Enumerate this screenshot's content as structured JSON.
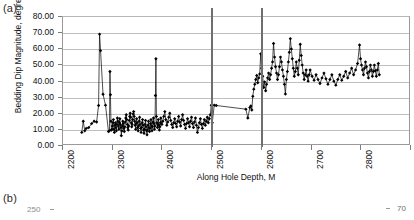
{
  "panels": {
    "a_label": "(a)",
    "b_label": "(b)"
  },
  "figure_b_partial": {
    "left_tick_label": "250",
    "right_tick_label": "70"
  },
  "chart_data": {
    "type": "line",
    "title": "",
    "xlabel": "Along Hole Depth, M",
    "ylabel": "Bedding Dip Magnitude, degreed",
    "xlim": [
      2200,
      2900
    ],
    "ylim": [
      0,
      80
    ],
    "grid": true,
    "legend": "none",
    "marker": "filled-diamond",
    "line_color": "#000000",
    "marker_color": "#000000",
    "grid_color": "#bfbfbf",
    "xticks": [
      2200,
      2300,
      2400,
      2500,
      2600,
      2700,
      2800,
      2900
    ],
    "xtick_labels": [
      "2200",
      "2300",
      "2400",
      "2500",
      "2600",
      "2700",
      "2800",
      "2900"
    ],
    "xtick_rotation": -90,
    "yticks": [
      0,
      10,
      20,
      30,
      40,
      50,
      60,
      70,
      80
    ],
    "ytick_labels": [
      "0.00",
      "10.00",
      "20.00",
      "30.00",
      "40.00",
      "50.00",
      "60.00",
      "70.00",
      "80.00"
    ],
    "annotations": [
      {
        "type": "vertical-line",
        "x": 2500,
        "color": "#6e6e6e",
        "label": ""
      },
      {
        "type": "vertical-line",
        "x": 2600,
        "color": "#6e6e6e",
        "label": ""
      }
    ],
    "series": [
      {
        "name": "Bedding Dip Magnitude",
        "x": [
          2238,
          2241,
          2244,
          2247,
          2252,
          2258,
          2263,
          2268,
          2272,
          2274,
          2276,
          2281,
          2286,
          2292,
          2294,
          2295,
          2296,
          2297,
          2298,
          2299,
          2300,
          2301,
          2302,
          2303,
          2304,
          2305,
          2306,
          2307,
          2308,
          2309,
          2310,
          2311,
          2312,
          2313,
          2314,
          2315,
          2316,
          2317,
          2318,
          2319,
          2320,
          2321,
          2322,
          2323,
          2324,
          2325,
          2326,
          2327,
          2328,
          2329,
          2330,
          2331,
          2332,
          2333,
          2334,
          2335,
          2336,
          2337,
          2338,
          2339,
          2340,
          2341,
          2342,
          2343,
          2344,
          2345,
          2346,
          2347,
          2348,
          2349,
          2350,
          2351,
          2352,
          2353,
          2354,
          2355,
          2356,
          2357,
          2358,
          2359,
          2360,
          2361,
          2362,
          2363,
          2364,
          2365,
          2366,
          2367,
          2368,
          2369,
          2370,
          2371,
          2372,
          2373,
          2374,
          2375,
          2376,
          2377,
          2378,
          2379,
          2380,
          2381,
          2382,
          2383,
          2384,
          2385,
          2386,
          2387,
          2388,
          2389,
          2390,
          2391,
          2392,
          2393,
          2394,
          2395,
          2396,
          2397,
          2398,
          2400,
          2402,
          2404,
          2406,
          2408,
          2410,
          2412,
          2414,
          2416,
          2418,
          2420,
          2422,
          2424,
          2426,
          2428,
          2430,
          2432,
          2434,
          2436,
          2438,
          2440,
          2442,
          2444,
          2446,
          2448,
          2450,
          2452,
          2454,
          2456,
          2458,
          2460,
          2462,
          2464,
          2466,
          2468,
          2470,
          2472,
          2474,
          2476,
          2478,
          2480,
          2482,
          2484,
          2486,
          2488,
          2490,
          2492,
          2494,
          2496,
          2498,
          2500,
          2502,
          2506,
          2510,
          2570,
          2574,
          2578,
          2580,
          2582,
          2584,
          2586,
          2588,
          2590,
          2592,
          2594,
          2596,
          2598,
          2600,
          2602,
          2604,
          2606,
          2608,
          2610,
          2612,
          2614,
          2616,
          2618,
          2620,
          2622,
          2624,
          2626,
          2628,
          2630,
          2632,
          2634,
          2636,
          2638,
          2640,
          2642,
          2644,
          2646,
          2648,
          2650,
          2652,
          2654,
          2656,
          2658,
          2660,
          2662,
          2664,
          2666,
          2668,
          2670,
          2672,
          2674,
          2676,
          2678,
          2680,
          2682,
          2684,
          2686,
          2688,
          2690,
          2692,
          2694,
          2696,
          2698,
          2700,
          2704,
          2708,
          2712,
          2716,
          2720,
          2724,
          2728,
          2732,
          2736,
          2740,
          2744,
          2748,
          2752,
          2756,
          2760,
          2764,
          2768,
          2772,
          2776,
          2780,
          2784,
          2788,
          2792,
          2796,
          2800,
          2802,
          2804,
          2806,
          2808,
          2810,
          2812,
          2814,
          2816,
          2818,
          2820,
          2822,
          2824,
          2826,
          2828,
          2830,
          2832,
          2834,
          2836,
          2838,
          2840
        ],
        "y": [
          8.0,
          15.0,
          9.0,
          10.5,
          11.0,
          13.5,
          15.0,
          14.5,
          24.8,
          69.3,
          59.0,
          31.8,
          25.0,
          8.5,
          9.0,
          46.0,
          31.5,
          15.0,
          9.5,
          10.0,
          12.0,
          14.0,
          16.0,
          10.0,
          8.0,
          12.5,
          14.0,
          11.0,
          9.0,
          13.0,
          17.0,
          15.0,
          12.0,
          10.0,
          14.0,
          16.5,
          13.0,
          11.0,
          6.0,
          9.0,
          12.0,
          15.0,
          13.5,
          10.5,
          8.5,
          11.5,
          14.5,
          17.0,
          19.0,
          16.0,
          13.0,
          11.0,
          9.5,
          12.0,
          15.5,
          18.0,
          20.0,
          17.5,
          14.0,
          11.5,
          13.0,
          16.0,
          19.5,
          21.0,
          18.0,
          15.0,
          12.5,
          10.0,
          13.5,
          16.5,
          14.0,
          11.0,
          9.0,
          12.0,
          15.0,
          17.5,
          13.0,
          10.5,
          8.0,
          11.0,
          14.0,
          16.0,
          12.5,
          9.5,
          7.5,
          10.0,
          13.0,
          15.5,
          11.5,
          9.0,
          6.5,
          9.5,
          12.5,
          15.0,
          11.0,
          8.5,
          10.5,
          13.5,
          16.0,
          12.0,
          9.0,
          11.5,
          14.5,
          17.0,
          13.5,
          10.0,
          12.0,
          31.0,
          54.0,
          18.0,
          14.0,
          11.0,
          13.0,
          16.0,
          12.5,
          9.5,
          11.5,
          14.0,
          17.0,
          13.0,
          15.0,
          18.0,
          21.0,
          16.0,
          12.5,
          14.5,
          17.5,
          20.0,
          15.5,
          13.0,
          11.0,
          14.0,
          16.5,
          13.5,
          11.5,
          15.0,
          18.0,
          14.5,
          12.0,
          16.0,
          19.0,
          15.5,
          13.0,
          10.5,
          13.5,
          16.5,
          14.0,
          11.5,
          15.0,
          17.5,
          13.5,
          11.0,
          14.5,
          17.0,
          12.5,
          8.0,
          11.0,
          14.0,
          16.5,
          13.0,
          10.5,
          13.5,
          16.0,
          12.5,
          15.0,
          17.5,
          14.0,
          16.5,
          19.0,
          25.0,
          14.0,
          25.0,
          24.8,
          22.5,
          17.0,
          23.5,
          24.5,
          22.0,
          30.5,
          35.0,
          38.0,
          41.0,
          43.5,
          39.0,
          42.0,
          44.5,
          57.0,
          48.0,
          43.0,
          36.0,
          39.5,
          34.0,
          38.0,
          42.0,
          45.0,
          41.0,
          44.0,
          48.0,
          52.0,
          63.5,
          55.0,
          49.0,
          45.0,
          41.0,
          44.0,
          49.0,
          55.0,
          52.0,
          47.0,
          43.0,
          38.0,
          32.0,
          41.0,
          46.0,
          52.0,
          58.0,
          66.5,
          60.0,
          54.0,
          48.0,
          43.0,
          46.0,
          52.0,
          48.0,
          44.0,
          53.0,
          63.0,
          56.0,
          50.0,
          45.0,
          41.0,
          44.0,
          47.0,
          43.0,
          40.0,
          44.0,
          47.0,
          43.0,
          40.5,
          44.0,
          41.0,
          38.5,
          42.0,
          45.0,
          41.5,
          38.0,
          41.0,
          44.0,
          40.0,
          37.5,
          41.0,
          44.0,
          40.5,
          43.0,
          46.0,
          42.0,
          45.0,
          48.0,
          44.0,
          47.0,
          51.0,
          62.5,
          54.0,
          50.0,
          47.0,
          44.0,
          48.0,
          52.0,
          49.0,
          45.0,
          42.0,
          46.0,
          50.0,
          47.0,
          43.0,
          46.0,
          50.0,
          46.5,
          43.0,
          47.0,
          51.0,
          44.0
        ]
      }
    ]
  }
}
